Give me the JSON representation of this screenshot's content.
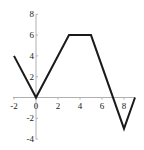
{
  "chart_data": {
    "type": "line",
    "title": "",
    "xlabel": "",
    "ylabel": "",
    "xlim": [
      -2,
      9
    ],
    "ylim": [
      -4,
      8
    ],
    "grid": false,
    "legend": null,
    "x_ticks": [
      -2,
      0,
      2,
      4,
      6,
      8
    ],
    "y_ticks": [
      -4,
      -2,
      2,
      4,
      6,
      8
    ],
    "x_tick_labels": [
      "-2",
      "0",
      "2",
      "4",
      "6",
      "8"
    ],
    "y_tick_labels": [
      "-4",
      "-2",
      "2",
      "4",
      "6",
      "8"
    ],
    "series": [
      {
        "name": "f(x)",
        "x": [
          -2,
          0,
          3,
          5,
          8,
          9
        ],
        "y": [
          4,
          0,
          6,
          6,
          -3,
          0
        ],
        "color": "#1a1a1a"
      }
    ],
    "axis_color": "#b0b0b0"
  }
}
